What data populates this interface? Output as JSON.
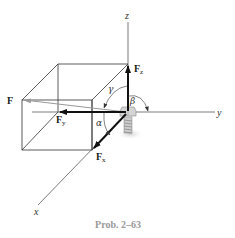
{
  "figure": {
    "caption": "Prob. 2–63",
    "axes": {
      "x": "x",
      "y": "y",
      "z": "z"
    },
    "force": {
      "label": "F"
    },
    "components": {
      "fx": {
        "main": "F",
        "sub": "x"
      },
      "fy": {
        "main": "F",
        "sub": "y"
      },
      "fz": {
        "main": "F",
        "sub": "z"
      }
    },
    "angles": {
      "alpha": "α",
      "beta": "β",
      "gamma": "γ"
    },
    "colors": {
      "lines": "#222222",
      "force_resultant": "#9a9a9a",
      "caption": "#9a9a9a",
      "bolt": "#b8b8b8"
    }
  }
}
